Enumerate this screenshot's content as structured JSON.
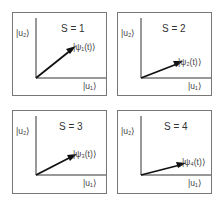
{
  "diagram": {
    "type": "state-vector-panels",
    "panels": [
      {
        "title": "S = 1",
        "y_axis_label": "|u₂⟩",
        "x_axis_label": "|u₁⟩",
        "vector_label": "|ψ₁(t)⟩",
        "vector_end": [
          52,
          30
        ]
      },
      {
        "title": "S = 2",
        "y_axis_label": "|u₂⟩",
        "x_axis_label": "|u₁⟩",
        "vector_label": "|ψ₂(t)⟩",
        "vector_end": [
          57,
          41
        ]
      },
      {
        "title": "S = 3",
        "y_axis_label": "|u₂⟩",
        "x_axis_label": "|u₁⟩",
        "vector_label": "|ψ₃(t)⟩",
        "vector_end": [
          55,
          36
        ]
      },
      {
        "title": "S = 4",
        "y_axis_label": "|u₂⟩",
        "x_axis_label": "|u₁⟩",
        "vector_label": "|ψ₄(t)⟩",
        "vector_end": [
          58,
          44
        ]
      }
    ],
    "colors": {
      "frame": "#777777",
      "axis": "#333333",
      "vector": "#111111",
      "text": "#444444"
    }
  }
}
